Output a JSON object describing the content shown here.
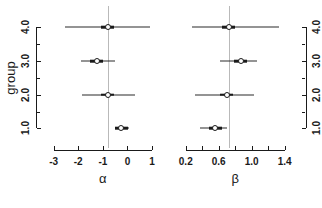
{
  "figure": {
    "background": "#ffffff",
    "line_color": "#1a1a1a",
    "refline_color": "#b9b9b9"
  },
  "chart_data": [
    {
      "type": "scatter",
      "panel": "left",
      "title": "",
      "xlabel": "α",
      "ylabel": "group",
      "xlim": [
        -3.35,
        1.2
      ],
      "ylim": [
        0.6,
        4.45
      ],
      "grid": false,
      "legend": null,
      "xticks": [
        -3,
        -2,
        -1,
        0,
        1
      ],
      "xticklabels": [
        "-3",
        "-2",
        "-1",
        "0",
        "1"
      ],
      "yticks": [
        1.0,
        2.0,
        3.0,
        4.0
      ],
      "yticklabels": [
        "1.0",
        "2.0",
        "3.0",
        "4.0"
      ],
      "yminorticks": [
        1.5,
        2.5,
        3.5
      ],
      "reference_line": -0.8,
      "categories": [
        "1.0",
        "2.0",
        "3.0",
        "4.0"
      ],
      "points": [
        {
          "group": 1.0,
          "estimate": -0.25,
          "lower": -0.52,
          "upper": 0.08
        },
        {
          "group": 2.0,
          "estimate": -0.8,
          "lower": -1.86,
          "upper": 0.3
        },
        {
          "group": 3.0,
          "estimate": -1.25,
          "lower": -1.9,
          "upper": -0.52
        },
        {
          "group": 4.0,
          "estimate": -0.8,
          "lower": -2.52,
          "upper": 0.92
        }
      ]
    },
    {
      "type": "scatter",
      "panel": "right",
      "title": "",
      "xlabel": "β",
      "ylabel": "",
      "xlim": [
        0.13,
        1.55
      ],
      "ylim": [
        0.6,
        4.45
      ],
      "grid": false,
      "legend": null,
      "xticks": [
        0.2,
        0.4,
        0.6,
        0.8,
        1.0,
        1.2,
        1.4
      ],
      "xticklabels": [
        "0.2",
        "",
        "0.6",
        "",
        "1.0",
        "",
        "1.4"
      ],
      "yticks": [
        1.0,
        2.0,
        3.0,
        4.0
      ],
      "yticklabels": [
        "1.0",
        "2.0",
        "3.0",
        "4.0"
      ],
      "yminorticks": [
        1.5,
        2.5,
        3.5
      ],
      "yaxis_side": "right",
      "reference_line": 0.72,
      "categories": [
        "1.0",
        "2.0",
        "3.0",
        "4.0"
      ],
      "points": [
        {
          "group": 1.0,
          "estimate": 0.56,
          "lower": 0.37,
          "upper": 0.7
        },
        {
          "group": 2.0,
          "estimate": 0.7,
          "lower": 0.31,
          "upper": 1.03
        },
        {
          "group": 3.0,
          "estimate": 0.87,
          "lower": 0.61,
          "upper": 1.07
        },
        {
          "group": 4.0,
          "estimate": 0.72,
          "lower": 0.28,
          "upper": 1.33
        }
      ]
    }
  ]
}
